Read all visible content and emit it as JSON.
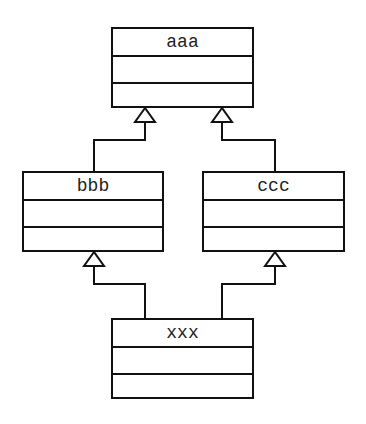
{
  "diagram": {
    "type": "UML class inheritance",
    "classes": [
      {
        "id": "aaa",
        "name": "aaa"
      },
      {
        "id": "bbb",
        "name": "bbb"
      },
      {
        "id": "ccc",
        "name": "ccc"
      },
      {
        "id": "xxx",
        "name": "xxx"
      }
    ],
    "generalizations": [
      {
        "from": "bbb",
        "to": "aaa"
      },
      {
        "from": "ccc",
        "to": "aaa"
      },
      {
        "from": "xxx",
        "to": "bbb"
      },
      {
        "from": "xxx",
        "to": "ccc"
      }
    ]
  }
}
